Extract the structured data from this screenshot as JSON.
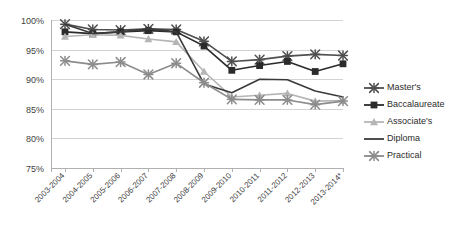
{
  "chart_data": {
    "type": "line",
    "title": "",
    "subtitle": "",
    "xlabel": "",
    "ylabel": "",
    "ylim": [
      75,
      100
    ],
    "ytick_labels": [
      "100%",
      "95%",
      "90%",
      "85%",
      "80%",
      "75%"
    ],
    "ytick_values": [
      100,
      95,
      90,
      85,
      80,
      75
    ],
    "grid": true,
    "legend_position": "right",
    "categories": [
      "2003-2004",
      "2004-2005",
      "2005-2006",
      "2006-2007",
      "2007-2008",
      "2008-2009",
      "2009-2010",
      "2010-2011",
      "2011-2012",
      "2012-2013",
      "2013-2014*"
    ],
    "series": [
      {
        "name": "Master's",
        "color": "#4f4f4f",
        "marker": "x-cross",
        "values": [
          99.3,
          98.4,
          98.3,
          98.5,
          98.4,
          96.4,
          93.0,
          93.3,
          93.9,
          94.2,
          94.0
        ]
      },
      {
        "name": "Baccalaureate",
        "color": "#2b2b2b",
        "marker": "square",
        "values": [
          98.0,
          97.7,
          98.0,
          98.2,
          98.0,
          95.6,
          91.5,
          92.3,
          93.0,
          91.3,
          92.6
        ]
      },
      {
        "name": "Associate's",
        "color": "#b5b5b5",
        "marker": "triangle",
        "values": [
          97.2,
          97.5,
          97.4,
          96.8,
          96.3,
          91.3,
          87.0,
          87.3,
          87.6,
          86.3,
          86.4
        ]
      },
      {
        "name": "Diploma",
        "color": "#3a3a3a",
        "marker": "none",
        "values": [
          99.3,
          97.7,
          98.0,
          98.5,
          98.0,
          89.2,
          87.7,
          90.0,
          89.9,
          88.0,
          87.0
        ]
      },
      {
        "name": "Practical",
        "color": "#8c8c8c",
        "marker": "x-cross",
        "values": [
          93.1,
          92.5,
          92.9,
          90.8,
          92.7,
          89.4,
          86.6,
          86.5,
          86.5,
          85.7,
          86.3
        ]
      }
    ]
  },
  "legend": {
    "items": [
      {
        "label": "Master's"
      },
      {
        "label": "Baccalaureate"
      },
      {
        "label": "Associate's"
      },
      {
        "label": "Diploma"
      },
      {
        "label": "Practical"
      }
    ]
  },
  "geometry": {
    "plot_left": 51,
    "plot_right": 343,
    "plot_top": 20,
    "plot_bottom": 168,
    "first_point_x": 65,
    "point_spacing": 27.8,
    "legend_x": 364,
    "legend_y": 88,
    "legend_row_height": 17,
    "legend_marker_len": 20
  }
}
